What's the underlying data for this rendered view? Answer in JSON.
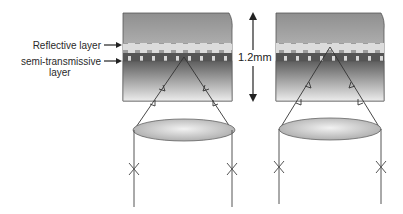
{
  "diagram": {
    "labels": {
      "reflective_layer": "Reflective layer",
      "semi_transmissive_line1": "semi-transmissive",
      "semi_transmissive_line2": "layer",
      "thickness": "1.2mm"
    },
    "panels": [
      {
        "id": "left",
        "focus": "semi-transmissive layer"
      },
      {
        "id": "right",
        "focus": "reflective layer"
      }
    ],
    "colors": {
      "substrate_top": "#9a9a9a",
      "substrate_light": "#e6e6e6",
      "reflective_layer": "#d9d9d9",
      "semi_transmissive_band": "#5a5a5a",
      "lower_substrate_dark": "#6e6e6e",
      "lower_substrate_light": "#e8e8e8",
      "lens": "#c8c8c8",
      "line": "#444444"
    }
  }
}
